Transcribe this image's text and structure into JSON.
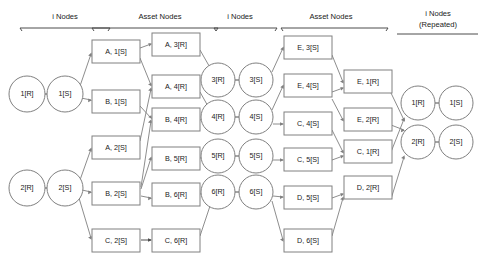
{
  "figure": {
    "title": "",
    "type": "node-graph-diagram",
    "background_color": "#ffffff",
    "node_stroke_color": "#808080",
    "edge_color": "#808080",
    "text_color": "#1a1a1a"
  },
  "headers": [
    {
      "id": "hdr-i-nodes-left",
      "line1": "i Nodes",
      "line2": ""
    },
    {
      "id": "hdr-asset-nodes-left",
      "line1": "Asset Nodes",
      "line2": ""
    },
    {
      "id": "hdr-i-nodes-mid",
      "line1": "i Nodes",
      "line2": ""
    },
    {
      "id": "hdr-asset-nodes-right",
      "line1": "Asset Nodes",
      "line2": ""
    },
    {
      "id": "hdr-i-nodes-repeated",
      "line1": "i Nodes",
      "line2": "(Repeated)"
    }
  ],
  "columns": {
    "i_nodes_left_r": {
      "label": "i Nodes R column (left)",
      "nodes": [
        "1[R]",
        "2[R]"
      ]
    },
    "i_nodes_left_s": {
      "label": "i Nodes S column (left)",
      "nodes": [
        "1[S]",
        "2[S]"
      ]
    },
    "asset_left_s": {
      "label": "Asset Nodes S column (left)",
      "nodes": [
        "A, 1[S]",
        "B, 1[S]",
        "A, 2[S]",
        "B, 2[S]",
        "C, 2[S]"
      ]
    },
    "asset_left_r": {
      "label": "Asset Nodes R column (left)",
      "nodes": [
        "A, 3[R]",
        "A, 4[R]",
        "B, 4[R]",
        "B, 5[R]",
        "B, 6[R]",
        "C, 6[R]"
      ]
    },
    "i_nodes_mid_r": {
      "label": "i Nodes R column (middle)",
      "nodes": [
        "3[R]",
        "4[R]",
        "5[R]",
        "6[R]"
      ]
    },
    "i_nodes_mid_s": {
      "label": "i Nodes S column (middle)",
      "nodes": [
        "3[S]",
        "4[S]",
        "5[S]",
        "6[S]"
      ]
    },
    "asset_right_s": {
      "label": "Asset Nodes S column (right)",
      "nodes": [
        "E, 3[S]",
        "E, 4[S]",
        "C, 4[S]",
        "C, 5[S]",
        "D, 5[S]",
        "D, 6[S]"
      ]
    },
    "asset_right_r": {
      "label": "Asset Nodes R column (right)",
      "nodes": [
        "E, 1[R]",
        "E, 2[R]",
        "C, 1[R]",
        "D, 2[R]"
      ]
    },
    "i_nodes_rep_r": {
      "label": "i Nodes R column (repeated)",
      "nodes": [
        "1[R]",
        "2[R]"
      ]
    },
    "i_nodes_rep_s": {
      "label": "i Nodes S column (repeated)",
      "nodes": [
        "1[S]",
        "2[S]"
      ]
    }
  },
  "nodes": {
    "c_1r_left": "1[R]",
    "c_1s_left": "1[S]",
    "c_2r_left": "2[R]",
    "c_2s_left": "2[S]",
    "b_a1s": "A, 1[S]",
    "b_b1s": "B, 1[S]",
    "b_a2s": "A, 2[S]",
    "b_b2s": "B, 2[S]",
    "b_c2s": "C, 2[S]",
    "b_a3r": "A, 3[R]",
    "b_a4r": "A, 4[R]",
    "b_b4r": "B, 4[R]",
    "b_b5r": "B, 5[R]",
    "b_b6r": "B, 6[R]",
    "b_c6r": "C, 6[R]",
    "c_3r": "3[R]",
    "c_3s": "3[S]",
    "c_4r": "4[R]",
    "c_4s": "4[S]",
    "c_5r": "5[R]",
    "c_5s": "5[S]",
    "c_6r": "6[R]",
    "c_6s": "6[S]",
    "b_e3s": "E, 3[S]",
    "b_e4s": "E, 4[S]",
    "b_c4s": "C, 4[S]",
    "b_c5s": "C, 5[S]",
    "b_d5s": "D, 5[S]",
    "b_d6s": "D, 6[S]",
    "b_e1r": "E, 1[R]",
    "b_e2r": "E, 2[R]",
    "b_c1r": "C, 1[R]",
    "b_d2r": "D, 2[R]",
    "c_1r_rep": "1[R]",
    "c_1s_rep": "1[S]",
    "c_2r_rep": "2[R]",
    "c_2s_rep": "2[S]"
  }
}
